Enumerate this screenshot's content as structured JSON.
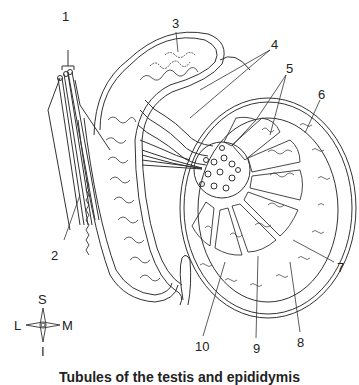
{
  "figure": {
    "caption": "Tubules of the testis and epididymis",
    "labels": [
      {
        "id": "1",
        "text": "1",
        "x": 62,
        "y": 10
      },
      {
        "id": "2",
        "text": "2",
        "x": 49,
        "y": 253
      },
      {
        "id": "3",
        "text": "3",
        "x": 172,
        "y": 18
      },
      {
        "id": "4",
        "text": "4",
        "x": 269,
        "y": 40
      },
      {
        "id": "5",
        "text": "5",
        "x": 284,
        "y": 62
      },
      {
        "id": "6",
        "text": "6",
        "x": 316,
        "y": 88
      },
      {
        "id": "7",
        "text": "7",
        "x": 335,
        "y": 262
      },
      {
        "id": "8",
        "text": "8",
        "x": 297,
        "y": 339
      },
      {
        "id": "9",
        "text": "9",
        "x": 254,
        "y": 345
      },
      {
        "id": "10",
        "text": "10",
        "x": 195,
        "y": 343
      }
    ],
    "compass": {
      "superior": "S",
      "inferior": "I",
      "lateral": "L",
      "medial": "M"
    },
    "colors": {
      "line": "#333333",
      "background": "#ffffff"
    }
  }
}
